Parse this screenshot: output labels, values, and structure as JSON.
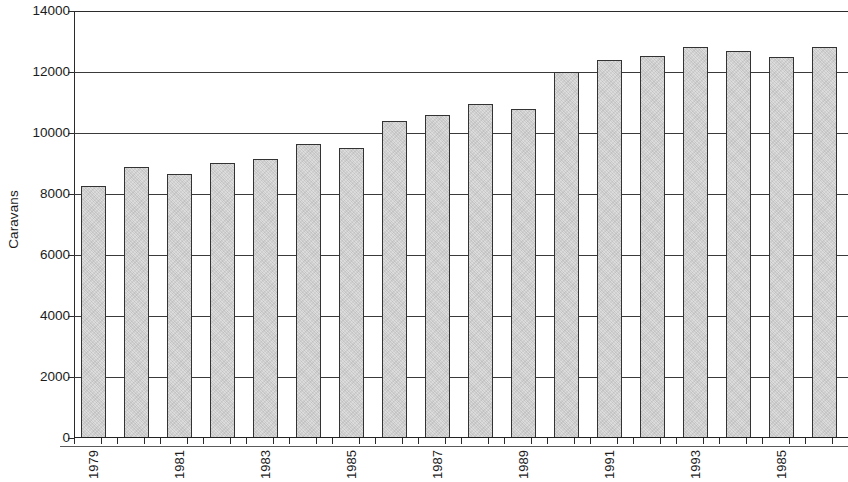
{
  "chart_data": {
    "type": "bar",
    "title": "",
    "subtitle": "",
    "xlabel": "",
    "ylabel": "Caravans",
    "ylim": [
      0,
      14000
    ],
    "ytick_values": [
      0,
      2000,
      4000,
      6000,
      8000,
      10000,
      12000,
      14000
    ],
    "ytick_labels": [
      "0",
      "2000",
      "4000",
      "6000",
      "8000",
      "10000",
      "12000",
      "14000"
    ],
    "grid": "horizontal",
    "legend": "none",
    "categories": [
      "1979",
      "1980",
      "1981",
      "1982",
      "1983",
      "1984",
      "1985",
      "1986",
      "1987",
      "1988",
      "1989",
      "1990",
      "1991",
      "1992",
      "1993",
      "1994",
      "1985",
      "1996"
    ],
    "xtick_labels_shown": [
      "1979",
      "",
      "1981",
      "",
      "1983",
      "",
      "1985",
      "",
      "1987",
      "",
      "1989",
      "",
      "1991",
      "",
      "1993",
      "",
      "1985",
      ""
    ],
    "values": [
      8250,
      8870,
      8650,
      9020,
      9150,
      9630,
      9520,
      10400,
      10600,
      10950,
      10780,
      12000,
      12400,
      12520,
      12830,
      12680,
      12480,
      12830
    ],
    "bar_color": "#dcdcdc",
    "bar_edge_color": "#333333",
    "axis_color": "#2b2b2b",
    "background_color": "#ffffff"
  }
}
